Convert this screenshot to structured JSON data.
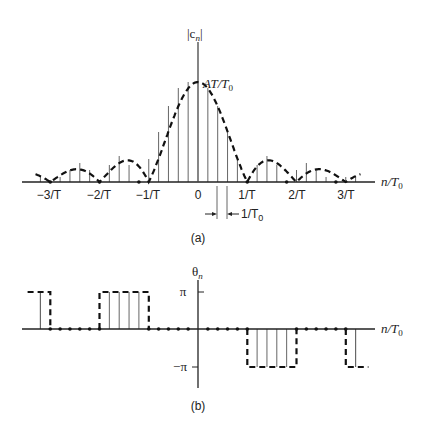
{
  "figure_a": {
    "y_label": "|c_n|",
    "y_label_main": "|c",
    "y_label_sub": "n",
    "y_label_close": "|",
    "peak_label_main": "AT/T",
    "peak_label_sub": "0",
    "x_label_main": "n/T",
    "x_label_sub": "0",
    "ticks": [
      "−3/T",
      "−2/T",
      "−1/T",
      "0",
      "1/T",
      "2/T",
      "3/T"
    ],
    "spacing_label_main": "1/T",
    "spacing_label_sub": "0",
    "caption": "(a)"
  },
  "figure_b": {
    "y_label_main": "θ",
    "y_label_sub": "n",
    "pi_label": "π",
    "neg_pi_label": "−π",
    "x_label_main": "n/T",
    "x_label_sub": "0",
    "caption": "(b)"
  },
  "chart_data": [
    {
      "type": "line",
      "title": "(a) Magnitude spectrum |c_n|",
      "xlabel": "n/T0",
      "ylabel": "|c_n|",
      "description": "Discrete spectral lines at spacing 1/T0 under a sinc envelope (dashed) with peak AT/T0 at 0 and zeros at ±1/T, ±2/T, ±3/T; 1/T = 5/T0",
      "x": [
        -16,
        -15,
        -14,
        -13,
        -12,
        -11,
        -10,
        -9,
        -8,
        -7,
        -6,
        -5,
        -4,
        -3,
        -2,
        -1,
        0,
        1,
        2,
        3,
        4,
        5,
        6,
        7,
        8,
        9,
        10,
        11,
        12,
        13,
        14,
        15,
        16
      ],
      "values_normalized": [
        0.05,
        0,
        0.05,
        0.12,
        0.19,
        0.12,
        0,
        0.17,
        0.26,
        0.17,
        0,
        0.23,
        0.5,
        0.76,
        0.94,
        1.0,
        1.0,
        0.94,
        0.76,
        0.5,
        0.23,
        0,
        0.17,
        0.26,
        0.17,
        0,
        0.12,
        0.19,
        0.12,
        0.05,
        0,
        0.05,
        0.05
      ],
      "peak_label": "AT/T0",
      "tick_labels": [
        "−3/T",
        "−2/T",
        "−1/T",
        "0",
        "1/T",
        "2/T",
        "3/T"
      ]
    },
    {
      "type": "line",
      "title": "(b) Phase spectrum θ_n",
      "xlabel": "n/T0",
      "ylabel": "θ_n",
      "description": "Phase is π for lobes left-negative, 0 on main lobe, −π on right odd lobes",
      "segments": [
        {
          "range": "n ≤ -16",
          "value": "π"
        },
        {
          "range": "-15 ≤ n ≤ -11",
          "value": "0"
        },
        {
          "range": "-10 ≤ n ≤ -5",
          "value": "π"
        },
        {
          "range": "-5 ≤ n ≤ 5",
          "value": "0"
        },
        {
          "range": "5 ≤ n ≤ 10",
          "value": "−π"
        },
        {
          "range": "10 ≤ n ≤ 15",
          "value": "0"
        },
        {
          "range": "n ≥ 15",
          "value": "−π"
        }
      ],
      "yticks": [
        "π",
        "−π"
      ]
    }
  ]
}
